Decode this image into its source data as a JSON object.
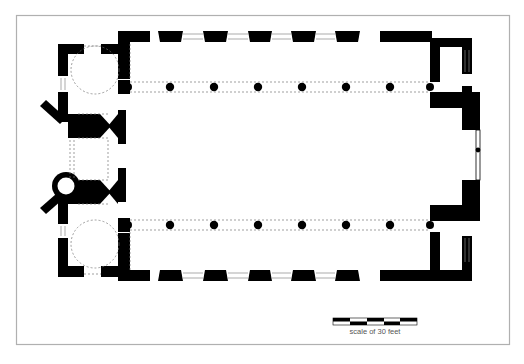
{
  "figure": {
    "type": "architectural floor plan"
  },
  "scale_bar": {
    "label": "scale of 30 feet",
    "segments": 5
  },
  "colonnades": {
    "north_columns": 6,
    "south_columns": 6
  },
  "colors": {
    "wall": "#000000",
    "frame": "#b0b0b0",
    "dashed": "#777777",
    "background": "#ffffff"
  }
}
